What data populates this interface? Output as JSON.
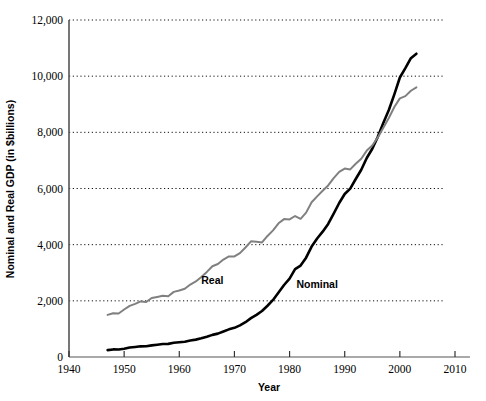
{
  "chart_data": {
    "type": "line",
    "title": "",
    "xlabel": "Year",
    "ylabel": "Nominal and Real GDP (in $billions)",
    "xlim": [
      1940,
      2010
    ],
    "ylim": [
      0,
      12000
    ],
    "grid": true,
    "grid_axis": "y",
    "legend_position": "inline-labels",
    "xticks": [
      1940,
      1950,
      1960,
      1970,
      1980,
      1990,
      2000,
      2010
    ],
    "xtick_labels": [
      "1940",
      "1950",
      "1960",
      "1970",
      "1980",
      "1990",
      "2000",
      "2010"
    ],
    "yticks": [
      0,
      2000,
      4000,
      6000,
      8000,
      10000,
      12000
    ],
    "ytick_labels": [
      "0",
      "2,000",
      "4,000",
      "6,000",
      "8,000",
      "10,000",
      "12,000"
    ],
    "series": [
      {
        "name": "Nominal",
        "color": "#000000",
        "label_x": 1985,
        "label_y": 2450,
        "x": [
          1947,
          1948,
          1949,
          1950,
          1951,
          1952,
          1953,
          1954,
          1955,
          1956,
          1957,
          1958,
          1959,
          1960,
          1961,
          1962,
          1963,
          1964,
          1965,
          1966,
          1967,
          1968,
          1969,
          1970,
          1971,
          1972,
          1973,
          1974,
          1975,
          1976,
          1977,
          1978,
          1979,
          1980,
          1981,
          1982,
          1983,
          1984,
          1985,
          1986,
          1987,
          1988,
          1989,
          1990,
          1991,
          1992,
          1993,
          1994,
          1995,
          1996,
          1997,
          1998,
          1999,
          2000,
          2001,
          2002,
          2003
        ],
        "values": [
          245,
          270,
          268,
          294,
          339,
          358,
          380,
          381,
          415,
          438,
          461,
          468,
          507,
          527,
          545,
          586,
          618,
          664,
          719,
          788,
          833,
          910,
          985,
          1039,
          1128,
          1240,
          1385,
          1501,
          1638,
          1825,
          2031,
          2295,
          2563,
          2790,
          3128,
          3255,
          3537,
          3933,
          4220,
          4463,
          4740,
          5104,
          5484,
          5803,
          5996,
          6338,
          6667,
          7085,
          7415,
          7839,
          8332,
          8794,
          9354,
          9952,
          10286,
          10642,
          10800
        ]
      },
      {
        "name": "Real",
        "color": "#808080",
        "label_x": 1966,
        "label_y": 2600,
        "x": [
          1947,
          1948,
          1949,
          1950,
          1951,
          1952,
          1953,
          1954,
          1955,
          1956,
          1957,
          1958,
          1959,
          1960,
          1961,
          1962,
          1963,
          1964,
          1965,
          1966,
          1967,
          1968,
          1969,
          1970,
          1971,
          1972,
          1973,
          1974,
          1975,
          1976,
          1977,
          1978,
          1979,
          1980,
          1981,
          1982,
          1983,
          1984,
          1985,
          1986,
          1987,
          1988,
          1989,
          1990,
          1991,
          1992,
          1993,
          1994,
          1995,
          1996,
          1997,
          1998,
          1999,
          2000,
          2001,
          2002,
          2003
        ],
        "values": [
          1500,
          1560,
          1550,
          1690,
          1820,
          1890,
          1980,
          1960,
          2100,
          2140,
          2180,
          2160,
          2320,
          2370,
          2430,
          2580,
          2690,
          2850,
          3030,
          3230,
          3310,
          3470,
          3580,
          3580,
          3700,
          3900,
          4120,
          4100,
          4080,
          4310,
          4510,
          4760,
          4910,
          4900,
          5020,
          4920,
          5140,
          5510,
          5720,
          5920,
          6110,
          6370,
          6590,
          6710,
          6680,
          6880,
          7060,
          7350,
          7530,
          7820,
          8160,
          8510,
          8900,
          9210,
          9290,
          9480,
          9600
        ]
      }
    ]
  }
}
